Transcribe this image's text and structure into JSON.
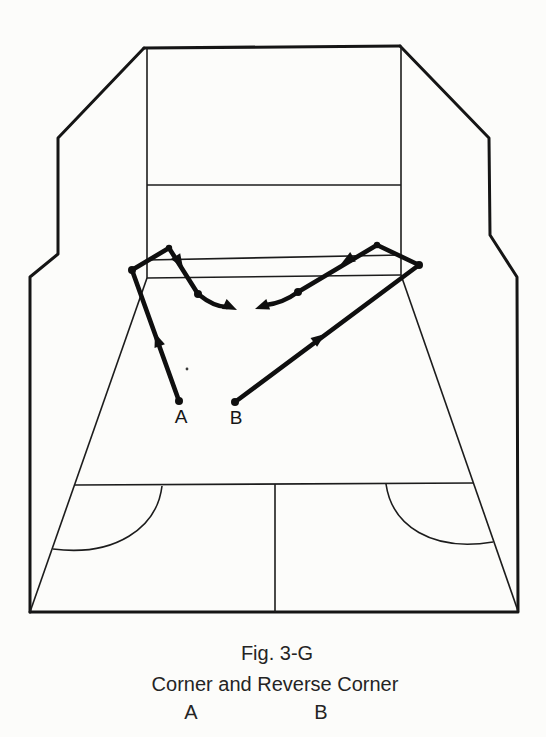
{
  "page": {
    "paper_color": "#fcfcfa",
    "ink_color": "#1a1a1a"
  },
  "diagram": {
    "type": "court-shot-diagram",
    "point_labels": {
      "a": "A",
      "b": "B"
    }
  },
  "caption": {
    "figure_number": "Fig. 3-G",
    "title": "Corner and Reverse Corner",
    "column_a": "A",
    "column_b": "B"
  }
}
